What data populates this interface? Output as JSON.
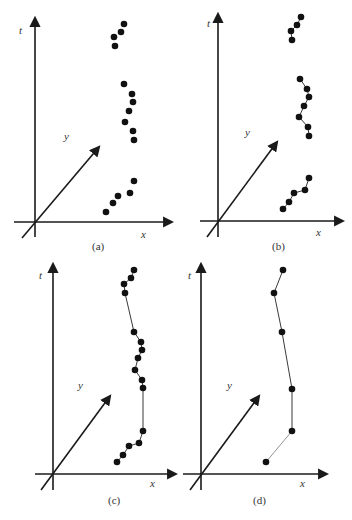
{
  "figure": {
    "colors": {
      "axis": "#1a1a1a",
      "point": "#111111",
      "line": "#222222",
      "background": "#ffffff"
    },
    "panels": [
      {
        "id": "a",
        "caption": "(a)",
        "axis_labels": {
          "t": "t",
          "y": "y",
          "x": "x"
        },
        "style": "points-only",
        "groups": [
          [
            [
              124,
              24
            ],
            [
              121,
              32
            ],
            [
              114,
              37
            ],
            [
              115,
              46
            ]
          ],
          [
            [
              124,
              84
            ],
            [
              132,
              94
            ],
            [
              133,
              102
            ],
            [
              129,
              111
            ],
            [
              125,
              122
            ],
            [
              133,
              131
            ],
            [
              134,
              140
            ]
          ],
          [
            [
              134,
              181
            ],
            [
              130,
              193
            ],
            [
              118,
              196
            ],
            [
              113,
              203
            ],
            [
              106,
              212
            ]
          ]
        ]
      },
      {
        "id": "b",
        "caption": "(b)",
        "axis_labels": {
          "t": "t",
          "y": "y",
          "x": "x"
        },
        "style": "points-linked-within-groups",
        "groups": [
          [
            [
              301,
              17
            ],
            [
              297,
              25
            ],
            [
              291,
              31
            ],
            [
              292,
              40
            ]
          ],
          [
            [
              300,
              79
            ],
            [
              307,
              89
            ],
            [
              309,
              97
            ],
            [
              304,
              106
            ],
            [
              299,
              117
            ],
            [
              308,
              127
            ],
            [
              309,
              136
            ]
          ],
          [
            [
              309,
              178
            ],
            [
              305,
              190
            ],
            [
              294,
              193
            ],
            [
              289,
              202
            ],
            [
              283,
              209
            ]
          ]
        ]
      },
      {
        "id": "c",
        "caption": "(c)",
        "axis_labels": {
          "t": "t",
          "y": "y",
          "x": "x"
        },
        "style": "points-linked-all",
        "groups": [
          [
            [
              134,
              270
            ],
            [
              131,
              278
            ],
            [
              124,
              284
            ],
            [
              125,
              293
            ],
            [
              134,
              332
            ],
            [
              141,
              342
            ],
            [
              142,
              350
            ],
            [
              138,
              358
            ],
            [
              135,
              370
            ],
            [
              142,
              380
            ],
            [
              143,
              388
            ],
            [
              143,
              431
            ],
            [
              139,
              443
            ],
            [
              129,
              446
            ],
            [
              123,
              455
            ],
            [
              117,
              462
            ]
          ]
        ]
      },
      {
        "id": "d",
        "caption": "(d)",
        "axis_labels": {
          "t": "t",
          "y": "y",
          "x": "x"
        },
        "style": "sparse-points-linked",
        "groups": [
          [
            [
              283,
              270
            ],
            [
              274,
              293
            ],
            [
              282,
              332
            ],
            [
              292,
              389
            ],
            [
              292,
              431
            ],
            [
              266,
              462
            ]
          ]
        ]
      }
    ]
  }
}
